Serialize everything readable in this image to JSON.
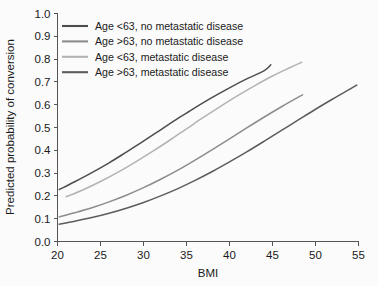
{
  "chart_data": {
    "type": "line",
    "title": "",
    "subtitle": "",
    "xlabel": "BMI",
    "ylabel": "Predicted probability of conversion",
    "xlim": [
      20,
      55
    ],
    "ylim": [
      0.0,
      1.0
    ],
    "xticks": [
      "20",
      "25",
      "30",
      "35",
      "40",
      "45",
      "50",
      "55"
    ],
    "xtick_values": [
      20,
      25,
      30,
      35,
      40,
      45,
      50,
      55
    ],
    "yticks": [
      "0.0",
      "0.1",
      "0.2",
      "0.3",
      "0.4",
      "0.5",
      "0.6",
      "0.7",
      "0.8",
      "0.9",
      "1.0"
    ],
    "ytick_values": [
      0.0,
      0.1,
      0.2,
      0.3,
      0.4,
      0.5,
      0.6,
      0.7,
      0.8,
      0.9,
      1.0
    ],
    "grid": false,
    "legend_position": "upper-left-inside",
    "series": [
      {
        "name": "Age <63, no metastatic disease",
        "color": "#4d4d4d",
        "x": [
          20.2,
          22,
          24,
          26,
          28,
          30,
          32,
          34,
          35,
          36,
          38,
          40,
          42,
          44,
          44.8
        ],
        "values": [
          0.228,
          0.262,
          0.302,
          0.345,
          0.392,
          0.44,
          0.49,
          0.54,
          0.563,
          0.587,
          0.632,
          0.674,
          0.713,
          0.748,
          0.775
        ]
      },
      {
        "name": "Age >63, no metastatic disease",
        "color": "#8c8c8c",
        "x": [
          20.2,
          22,
          24,
          26,
          28,
          30,
          32,
          34,
          36,
          38,
          40,
          42,
          44,
          46,
          48,
          48.5
        ],
        "values": [
          0.108,
          0.126,
          0.148,
          0.174,
          0.203,
          0.236,
          0.273,
          0.313,
          0.357,
          0.403,
          0.45,
          0.498,
          0.545,
          0.59,
          0.633,
          0.643
        ]
      },
      {
        "name": "Age <63, metastatic disease",
        "color": "#b3b3b3",
        "x": [
          21,
          23,
          25,
          27,
          29,
          31,
          33,
          35,
          37,
          39,
          41,
          43,
          45,
          47,
          48.4
        ],
        "values": [
          0.196,
          0.227,
          0.263,
          0.303,
          0.347,
          0.394,
          0.443,
          0.494,
          0.545,
          0.594,
          0.641,
          0.685,
          0.726,
          0.762,
          0.786
        ]
      },
      {
        "name": "Age >63, metastatic disease",
        "color": "#5c5c5c",
        "x": [
          20.2,
          22,
          24,
          26,
          28,
          30,
          32,
          34,
          36,
          38,
          40,
          42,
          44,
          46,
          48,
          50,
          52,
          54,
          54.8
        ],
        "values": [
          0.076,
          0.089,
          0.105,
          0.124,
          0.146,
          0.171,
          0.2,
          0.232,
          0.268,
          0.307,
          0.349,
          0.393,
          0.439,
          0.486,
          0.533,
          0.58,
          0.625,
          0.668,
          0.686
        ]
      }
    ]
  },
  "legend": {
    "items": [
      {
        "label": "Age <63, no metastatic disease",
        "color": "#4d4d4d"
      },
      {
        "label": "Age >63, no metastatic disease",
        "color": "#8c8c8c"
      },
      {
        "label": "Age <63, metastatic disease",
        "color": "#b3b3b3"
      },
      {
        "label": "Age >63, metastatic disease",
        "color": "#5c5c5c"
      }
    ]
  },
  "colors": {
    "background": "#fbfbfb",
    "axis": "#555555",
    "text": "#1a1a1a"
  }
}
